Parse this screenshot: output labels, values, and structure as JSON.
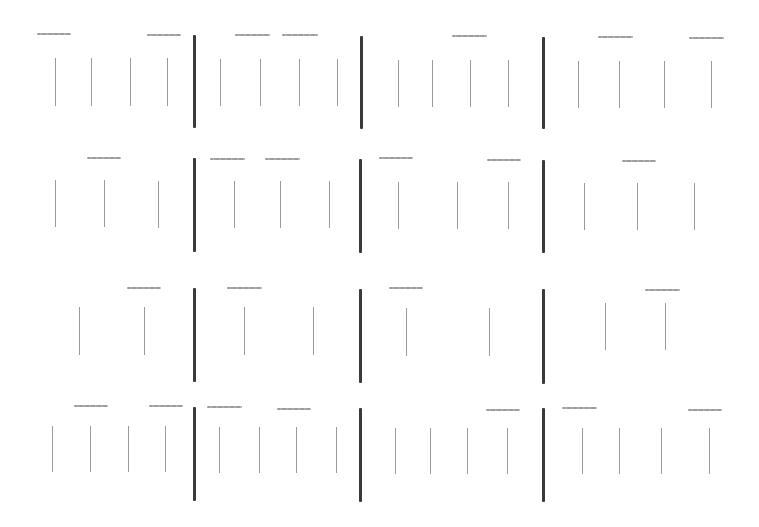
{
  "canvas": {
    "width": 759,
    "height": 527,
    "background": "#ffffff"
  },
  "colors": {
    "divider": "#3a3a3a",
    "stroke": "#9a9a9a",
    "dash_label": "#a4a4a4"
  },
  "note_text_visible": false,
  "dividers": [
    {
      "x": 193,
      "y": 35,
      "h": 93
    },
    {
      "x": 360,
      "y": 36,
      "h": 93
    },
    {
      "x": 542,
      "y": 37,
      "h": 92
    },
    {
      "x": 193,
      "y": 158,
      "h": 94
    },
    {
      "x": 359,
      "y": 159,
      "h": 94
    },
    {
      "x": 542,
      "y": 160,
      "h": 93
    },
    {
      "x": 193,
      "y": 288,
      "h": 94
    },
    {
      "x": 359,
      "y": 289,
      "h": 94
    },
    {
      "x": 542,
      "y": 289,
      "h": 95
    },
    {
      "x": 193,
      "y": 407,
      "h": 94
    },
    {
      "x": 359,
      "y": 408,
      "h": 94
    },
    {
      "x": 542,
      "y": 408,
      "h": 94
    }
  ],
  "strokes": [
    {
      "x": 55,
      "y": 58,
      "h": 48
    },
    {
      "x": 91,
      "y": 58,
      "h": 48
    },
    {
      "x": 130,
      "y": 58,
      "h": 48
    },
    {
      "x": 167,
      "y": 58,
      "h": 48
    },
    {
      "x": 220,
      "y": 59,
      "h": 47
    },
    {
      "x": 260,
      "y": 59,
      "h": 47
    },
    {
      "x": 299,
      "y": 59,
      "h": 47
    },
    {
      "x": 337,
      "y": 59,
      "h": 47
    },
    {
      "x": 398,
      "y": 60,
      "h": 47
    },
    {
      "x": 432,
      "y": 60,
      "h": 47
    },
    {
      "x": 470,
      "y": 60,
      "h": 47
    },
    {
      "x": 508,
      "y": 60,
      "h": 47
    },
    {
      "x": 578,
      "y": 61,
      "h": 47
    },
    {
      "x": 619,
      "y": 61,
      "h": 47
    },
    {
      "x": 664,
      "y": 61,
      "h": 47
    },
    {
      "x": 711,
      "y": 61,
      "h": 47
    },
    {
      "x": 55,
      "y": 180,
      "h": 47
    },
    {
      "x": 104,
      "y": 180,
      "h": 47
    },
    {
      "x": 158,
      "y": 181,
      "h": 47
    },
    {
      "x": 234,
      "y": 181,
      "h": 47
    },
    {
      "x": 280,
      "y": 181,
      "h": 47
    },
    {
      "x": 329,
      "y": 181,
      "h": 47
    },
    {
      "x": 398,
      "y": 182,
      "h": 47
    },
    {
      "x": 457,
      "y": 182,
      "h": 47
    },
    {
      "x": 508,
      "y": 182,
      "h": 47
    },
    {
      "x": 584,
      "y": 183,
      "h": 47
    },
    {
      "x": 637,
      "y": 183,
      "h": 47
    },
    {
      "x": 694,
      "y": 183,
      "h": 47
    },
    {
      "x": 79,
      "y": 307,
      "h": 48
    },
    {
      "x": 144,
      "y": 307,
      "h": 48
    },
    {
      "x": 244,
      "y": 307,
      "h": 48
    },
    {
      "x": 313,
      "y": 307,
      "h": 48
    },
    {
      "x": 406,
      "y": 308,
      "h": 48
    },
    {
      "x": 489,
      "y": 308,
      "h": 48
    },
    {
      "x": 605,
      "y": 303,
      "h": 47
    },
    {
      "x": 665,
      "y": 303,
      "h": 47
    },
    {
      "x": 52,
      "y": 426,
      "h": 46
    },
    {
      "x": 90,
      "y": 426,
      "h": 46
    },
    {
      "x": 128,
      "y": 426,
      "h": 46
    },
    {
      "x": 165,
      "y": 426,
      "h": 46
    },
    {
      "x": 219,
      "y": 427,
      "h": 46
    },
    {
      "x": 259,
      "y": 427,
      "h": 46
    },
    {
      "x": 296,
      "y": 427,
      "h": 46
    },
    {
      "x": 336,
      "y": 427,
      "h": 46
    },
    {
      "x": 395,
      "y": 428,
      "h": 46
    },
    {
      "x": 430,
      "y": 428,
      "h": 46
    },
    {
      "x": 467,
      "y": 428,
      "h": 46
    },
    {
      "x": 507,
      "y": 428,
      "h": 46
    },
    {
      "x": 582,
      "y": 428,
      "h": 46
    },
    {
      "x": 619,
      "y": 428,
      "h": 46
    },
    {
      "x": 661,
      "y": 428,
      "h": 46
    },
    {
      "x": 709,
      "y": 428,
      "h": 46
    }
  ],
  "dash_labels": [
    {
      "x": 37,
      "y": 33,
      "w": 34
    },
    {
      "x": 147,
      "y": 34,
      "w": 34
    },
    {
      "x": 235,
      "y": 34,
      "w": 35
    },
    {
      "x": 282,
      "y": 34,
      "w": 36
    },
    {
      "x": 452,
      "y": 35,
      "w": 35
    },
    {
      "x": 598,
      "y": 36,
      "w": 35
    },
    {
      "x": 689,
      "y": 37,
      "w": 35
    },
    {
      "x": 87,
      "y": 157,
      "w": 34
    },
    {
      "x": 210,
      "y": 158,
      "w": 35
    },
    {
      "x": 265,
      "y": 158,
      "w": 35
    },
    {
      "x": 379,
      "y": 157,
      "w": 34
    },
    {
      "x": 487,
      "y": 159,
      "w": 34
    },
    {
      "x": 622,
      "y": 160,
      "w": 34
    },
    {
      "x": 127,
      "y": 287,
      "w": 34
    },
    {
      "x": 227,
      "y": 287,
      "w": 35
    },
    {
      "x": 389,
      "y": 287,
      "w": 34
    },
    {
      "x": 645,
      "y": 289,
      "w": 35
    },
    {
      "x": 74,
      "y": 405,
      "w": 34
    },
    {
      "x": 149,
      "y": 405,
      "w": 34
    },
    {
      "x": 207,
      "y": 406,
      "w": 35
    },
    {
      "x": 277,
      "y": 408,
      "w": 34
    },
    {
      "x": 486,
      "y": 409,
      "w": 34
    },
    {
      "x": 562,
      "y": 407,
      "w": 35
    },
    {
      "x": 688,
      "y": 409,
      "w": 34
    }
  ]
}
